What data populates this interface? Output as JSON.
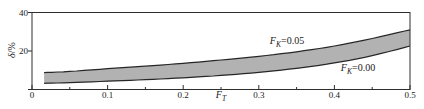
{
  "figure": {
    "background": "#ffffff"
  },
  "chart_data": {
    "type": "area",
    "title": "",
    "xlabel": {
      "base": "F",
      "sub": "T"
    },
    "ylabel": {
      "italic": "δ",
      "rest": "/%"
    },
    "xlim": [
      0,
      0.5
    ],
    "ylim": [
      0,
      40
    ],
    "grid": "off",
    "legend_position": "inline annotations on plot",
    "x_tick_labels": [
      "0",
      "0.1",
      "0.2",
      "0.3",
      "0.4",
      "0.5"
    ],
    "x_major_ticks": [
      0,
      0.1,
      0.2,
      0.3,
      0.4,
      0.5
    ],
    "x_minor_ticks": [
      0.05,
      0.15,
      0.25,
      0.35,
      0.45
    ],
    "y_tick_labels": [
      "0",
      "20",
      "40"
    ],
    "y_major_ticks": [
      0,
      20,
      40
    ],
    "x": [
      0.016,
      0.05,
      0.1,
      0.15,
      0.2,
      0.25,
      0.3,
      0.35,
      0.4,
      0.45,
      0.5
    ],
    "series": [
      {
        "name": "FK=0.05",
        "label": {
          "base": "F",
          "sub": "K",
          "rest": "=0.05"
        },
        "values": [
          8.8,
          9.4,
          10.8,
          12.1,
          13.6,
          15.3,
          17.2,
          19.6,
          22.6,
          26.5,
          31.0
        ]
      },
      {
        "name": "FK=0.00",
        "label": {
          "base": "F",
          "sub": "K",
          "rest": "=0.00"
        },
        "values": [
          3.2,
          3.6,
          4.3,
          5.1,
          6.1,
          7.3,
          8.9,
          11.0,
          13.8,
          17.6,
          22.6
        ]
      }
    ],
    "band_fill_between_series": true,
    "colors": {
      "band": "#b2b2b2",
      "curve": "#262626",
      "frame": "#2e2e2e",
      "text": "#1a1a1a"
    }
  }
}
